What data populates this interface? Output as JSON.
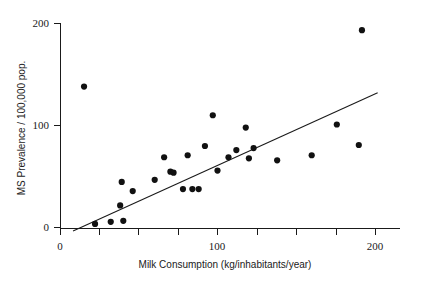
{
  "chart_data": {
    "type": "scatter",
    "title": "",
    "xlabel": "Milk Consumption (kg/inhabitants/year)",
    "ylabel": "MS Prevalence / 100,000 pop.",
    "xlim": [
      0,
      210
    ],
    "ylim": [
      0,
      205
    ],
    "xticks": [
      0,
      100,
      200
    ],
    "xtick_labels": [
      "0",
      "100",
      "200"
    ],
    "xminor_ticks": [
      25,
      50,
      75,
      125,
      150,
      175
    ],
    "yticks": [
      0,
      100,
      200
    ],
    "ytick_labels": [
      "0",
      "100",
      "200"
    ],
    "grid": false,
    "legend": null,
    "marker": "filled-circle",
    "marker_color": "#111111",
    "line_color": "#1a1a1a",
    "points": [
      {
        "x": 15,
        "y": 138
      },
      {
        "x": 22,
        "y": 4
      },
      {
        "x": 32,
        "y": 6
      },
      {
        "x": 38,
        "y": 22
      },
      {
        "x": 39,
        "y": 45
      },
      {
        "x": 40,
        "y": 7
      },
      {
        "x": 46,
        "y": 36
      },
      {
        "x": 60,
        "y": 47
      },
      {
        "x": 66,
        "y": 69
      },
      {
        "x": 70,
        "y": 55
      },
      {
        "x": 72,
        "y": 54
      },
      {
        "x": 78,
        "y": 38
      },
      {
        "x": 81,
        "y": 71
      },
      {
        "x": 84,
        "y": 38
      },
      {
        "x": 88,
        "y": 38
      },
      {
        "x": 92,
        "y": 80
      },
      {
        "x": 97,
        "y": 110
      },
      {
        "x": 100,
        "y": 56
      },
      {
        "x": 107,
        "y": 69
      },
      {
        "x": 112,
        "y": 76
      },
      {
        "x": 118,
        "y": 98
      },
      {
        "x": 120,
        "y": 68
      },
      {
        "x": 123,
        "y": 78
      },
      {
        "x": 138,
        "y": 66
      },
      {
        "x": 160,
        "y": 71
      },
      {
        "x": 176,
        "y": 101
      },
      {
        "x": 190,
        "y": 81
      },
      {
        "x": 192,
        "y": 193
      }
    ],
    "trend_line": {
      "x_start": 8,
      "y_start": -3,
      "x_end": 202,
      "y_end": 132
    }
  }
}
